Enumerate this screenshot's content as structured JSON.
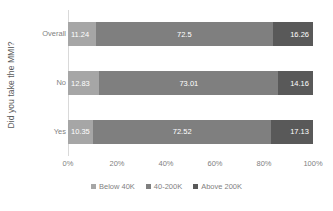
{
  "chart_data": {
    "type": "bar",
    "orientation": "horizontal",
    "stacked": true,
    "normalized_percent": true,
    "title": "",
    "xlabel": "",
    "ylabel": "Did you take the MMI?",
    "categories": [
      "Overall",
      "No",
      "Yes"
    ],
    "series": [
      {
        "name": "Below 40K",
        "values": [
          11.24,
          12.83,
          10.35
        ],
        "color": "#a6a6a6"
      },
      {
        "name": "40-200K",
        "values": [
          72.5,
          73.01,
          72.52
        ],
        "color": "#7f7f7f"
      },
      {
        "name": "Above 200K",
        "values": [
          16.26,
          14.16,
          17.13
        ],
        "color": "#595959"
      }
    ],
    "data_labels": [
      [
        "11.24",
        "72.5",
        "16.26"
      ],
      [
        "12.83",
        "73.01",
        "14.16"
      ],
      [
        "10.35",
        "72.52",
        "17.13"
      ]
    ],
    "xlim": [
      0,
      100
    ],
    "xticks": [
      0,
      20,
      40,
      60,
      80,
      100
    ],
    "xtick_labels": [
      "0%",
      "20%",
      "40%",
      "60%",
      "80%",
      "100%"
    ],
    "grid": false,
    "legend_position": "bottom",
    "axis_color": "#d9d9d9",
    "label_color": "#7f7f7f",
    "data_label_color": "#ffffff",
    "background": "#ffffff"
  }
}
